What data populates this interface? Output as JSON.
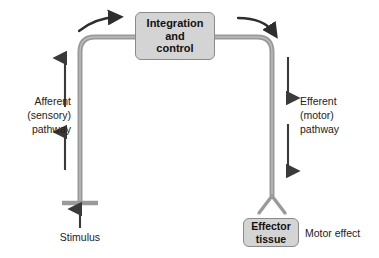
{
  "diagram": {
    "colors": {
      "pathway": "#9a9a9a",
      "pathway_edge": "#b5b5b5",
      "arrow": "#3a3a3a",
      "box_fill": "#d4d4d4",
      "box_border": "#8a8a8a",
      "text": "#111111",
      "background": "#ffffff"
    },
    "nodes": {
      "integration": {
        "lines": [
          "Integration",
          "and",
          "control"
        ],
        "text": "Integration and control",
        "shape": "rounded-rect",
        "x": 135,
        "y": 12,
        "width": 80,
        "height": 48
      },
      "effector": {
        "lines": [
          "Effector",
          "tissue"
        ],
        "text": "Effector tissue",
        "shape": "rounded-rect",
        "x": 243,
        "y": 218,
        "width": 56,
        "height": 29
      }
    },
    "labels": {
      "afferent": {
        "lines": [
          "Afferent",
          "(sensory)",
          "pathway"
        ],
        "text": "Afferent (sensory) pathway"
      },
      "efferent": {
        "lines": [
          "Efferent",
          "(motor)",
          "pathway"
        ],
        "text": "Efferent (motor) pathway"
      },
      "stimulus": {
        "text": "Stimulus"
      },
      "motor_effect": {
        "text": "Motor effect"
      }
    },
    "flow": {
      "direction": "stimulus -> afferent (sensory) pathway -> integration and control -> efferent (motor) pathway -> effector tissue -> motor effect",
      "afferent_arrow_direction": "up",
      "efferent_arrow_direction": "down",
      "stimulus_arrow_direction": "up",
      "top_left_arrow_direction": "right",
      "top_right_arrow_direction": "right-down"
    }
  }
}
